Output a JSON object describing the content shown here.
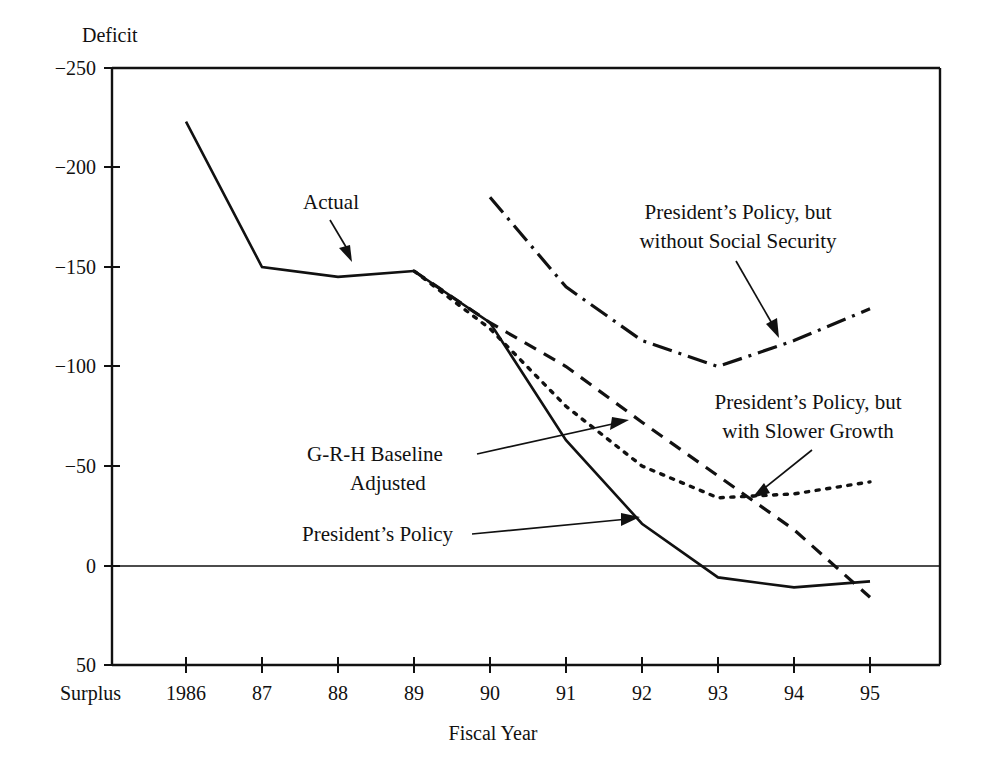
{
  "figure": {
    "y_axis_title": "Deficit",
    "x_axis_title": "Fiscal Year",
    "surplus_label": "Surplus"
  },
  "chart_data": {
    "type": "line",
    "title": "",
    "xlabel": "Fiscal Year",
    "ylabel": "Deficit",
    "grid": false,
    "legend": "annotations",
    "note": "Y axis is inverted: deficit plotted as negative numbers increasing downward to Surplus (+50 at bottom). Values in billions of dollars.",
    "categories": [
      "1986",
      "87",
      "88",
      "89",
      "90",
      "91",
      "92",
      "93",
      "94",
      "95"
    ],
    "x": [
      1986,
      1987,
      1988,
      1989,
      1990,
      1991,
      1992,
      1993,
      1994,
      1995
    ],
    "xlim": [
      1985.6,
      1995.6
    ],
    "ylim": [
      -250,
      50
    ],
    "yticks": [
      -250,
      -200,
      -150,
      -100,
      -50,
      0,
      50
    ],
    "ytick_labels": [
      "−250",
      "−200",
      "−150",
      "−100",
      "−50",
      "0",
      "50"
    ],
    "series": [
      {
        "name": "Actual",
        "style": "solid",
        "x": [
          1986,
          1987,
          1988,
          1989
        ],
        "values": [
          -223,
          -150,
          -145,
          -148
        ]
      },
      {
        "name": "President's Policy",
        "style": "solid",
        "x": [
          1989,
          1990,
          1991,
          1992,
          1993,
          1994,
          1995
        ],
        "values": [
          -148,
          -122,
          -63,
          -21,
          6,
          11,
          8
        ]
      },
      {
        "name": "G-R-H Baseline Adjusted",
        "style": "dashed",
        "x": [
          1989,
          1990,
          1991,
          1992,
          1993,
          1994,
          1995
        ],
        "values": [
          -148,
          -122,
          -100,
          -72,
          -45,
          -18,
          16
        ]
      },
      {
        "name": "President's Policy, but with Slower Growth",
        "style": "dotted",
        "x": [
          1989,
          1990,
          1991,
          1992,
          1993,
          1994,
          1995
        ],
        "values": [
          -148,
          -119,
          -80,
          -50,
          -34,
          -36,
          -42
        ]
      },
      {
        "name": "President's Policy, but without Social Security",
        "style": "dash-dot",
        "x": [
          1990,
          1991,
          1992,
          1993,
          1994,
          1995
        ],
        "values": [
          -185,
          -140,
          -113,
          -100,
          -113,
          -129
        ]
      }
    ]
  },
  "annotations": [
    {
      "id": "actual",
      "lines": [
        "Actual"
      ],
      "target_series": "Actual"
    },
    {
      "id": "president-policy-without-social-security",
      "lines": [
        "President’s Policy, but",
        "without Social Security"
      ],
      "target_series": "President's Policy, but without Social Security"
    },
    {
      "id": "grh-baseline-adjusted",
      "lines": [
        "G-R-H Baseline",
        "Adjusted"
      ],
      "target_series": "G-R-H Baseline Adjusted"
    },
    {
      "id": "president-policy-with-slower-growth",
      "lines": [
        "President’s Policy, but",
        "with Slower Growth"
      ],
      "target_series": "President's Policy, but with Slower Growth"
    },
    {
      "id": "president-policy",
      "lines": [
        "President’s Policy"
      ],
      "target_series": "President's Policy"
    }
  ],
  "colors": {
    "ink": "#111111",
    "background": "#ffffff"
  }
}
